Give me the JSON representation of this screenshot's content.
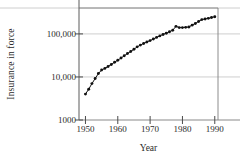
{
  "chart_data": {
    "type": "line",
    "title": "",
    "xlabel": "Year",
    "ylabel": "Insurance in force",
    "yscale": "log",
    "xlim": [
      1948,
      1991
    ],
    "ylim": [
      1000,
      400000
    ],
    "grid": true,
    "grid_orientation": "horizontal",
    "legend": false,
    "marker": "filled-circle",
    "yticks": [
      1000,
      10000,
      100000
    ],
    "ytick_labels": [
      "1000",
      "10,000",
      "100,000"
    ],
    "xticks": [
      1950,
      1960,
      1970,
      1980,
      1990
    ],
    "xtick_labels": [
      "1950",
      "1960",
      "1970",
      "1980",
      "1990"
    ],
    "series": [
      {
        "name": "Insurance in force",
        "x": [
          1950,
          1951,
          1952,
          1953,
          1954,
          1955,
          1956,
          1957,
          1958,
          1959,
          1960,
          1961,
          1962,
          1963,
          1964,
          1965,
          1966,
          1967,
          1968,
          1969,
          1970,
          1971,
          1972,
          1973,
          1974,
          1975,
          1976,
          1977,
          1978,
          1979,
          1980,
          1981,
          1982,
          1983,
          1984,
          1985,
          1986,
          1987,
          1988,
          1989,
          1990
        ],
        "values": [
          4000,
          5200,
          7000,
          9200,
          12000,
          14500,
          15800,
          17500,
          19500,
          22000,
          24500,
          27500,
          31000,
          35000,
          39000,
          44000,
          50000,
          55000,
          60000,
          65000,
          70000,
          76000,
          83000,
          90000,
          97000,
          104000,
          112000,
          122000,
          150000,
          140000,
          140000,
          142000,
          145000,
          160000,
          175000,
          195000,
          215000,
          222000,
          230000,
          240000,
          250000
        ]
      }
    ]
  },
  "axes": {
    "ylabel_text": "Insurance in force",
    "xlabel_text": "Year"
  }
}
